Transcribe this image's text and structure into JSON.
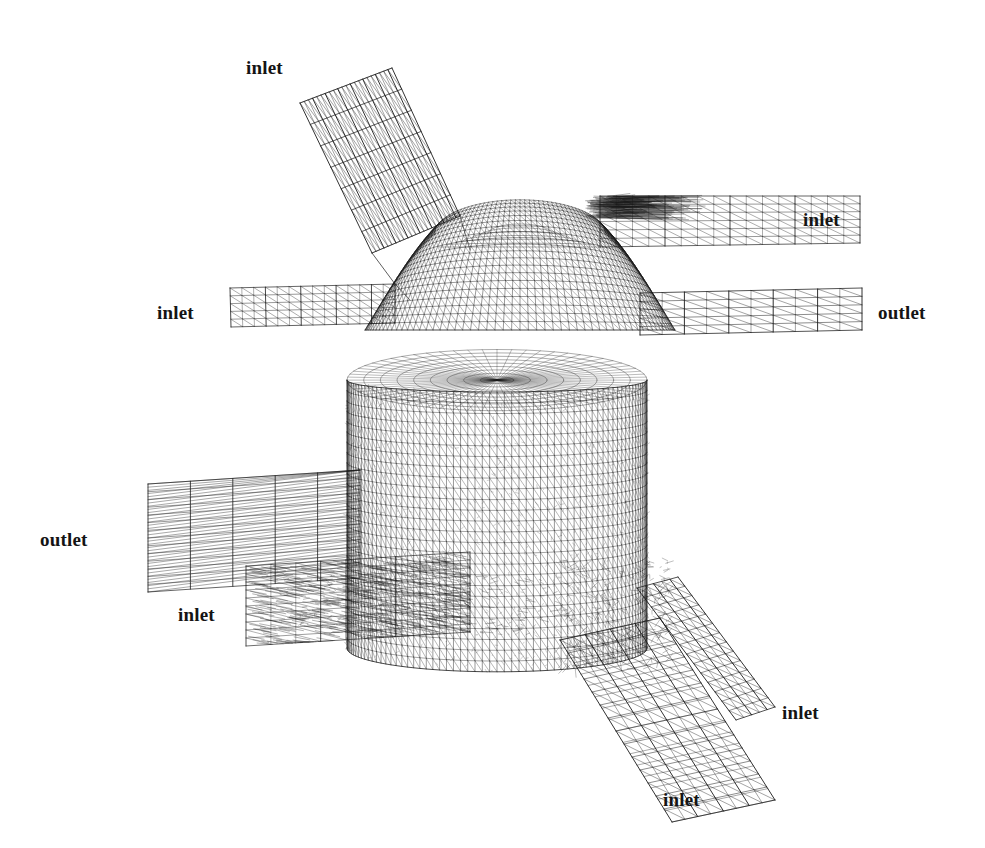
{
  "figure": {
    "name": "cfd-surface-mesh-figure",
    "background_color": "#ffffff",
    "ink_color": "#1a1a1a",
    "width": 985,
    "height": 848,
    "panels": [
      {
        "id": "top-panel",
        "description": "side view of domed mixing chamber with four ducts",
        "labels": [
          {
            "id": "top-inlet-angled",
            "text": "inlet",
            "x": 246,
            "y": 58
          },
          {
            "id": "top-inlet-right",
            "text": "inlet",
            "x": 803,
            "y": 210
          },
          {
            "id": "top-inlet-left",
            "text": "inlet",
            "x": 157,
            "y": 303
          },
          {
            "id": "top-outlet-right",
            "text": "outlet",
            "x": 878,
            "y": 303
          }
        ]
      },
      {
        "id": "bottom-panel",
        "description": "perspective view of cylindrical chamber with four ducts",
        "labels": [
          {
            "id": "bottom-outlet-left",
            "text": "outlet",
            "x": 40,
            "y": 530
          },
          {
            "id": "bottom-inlet-left",
            "text": "inlet",
            "x": 178,
            "y": 605
          },
          {
            "id": "bottom-inlet-right",
            "text": "inlet",
            "x": 782,
            "y": 703
          },
          {
            "id": "bottom-inlet-bottom",
            "text": "inlet",
            "x": 663,
            "y": 790
          }
        ]
      }
    ],
    "label_texts": {
      "inlet": "inlet",
      "outlet": "outlet"
    }
  }
}
